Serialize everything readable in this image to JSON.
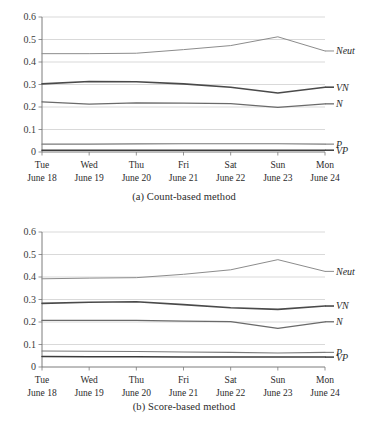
{
  "figures": [
    {
      "id": "a",
      "caption": "(a) Count-based method",
      "chart_data": {
        "type": "line",
        "title": "(a) Count-based method",
        "xlabel": "",
        "ylabel": "",
        "ylim": [
          0,
          0.6
        ],
        "yticks": [
          "0",
          "0.1",
          "0.2",
          "0.3",
          "0.4",
          "0.5",
          "0.6"
        ],
        "ytick_values": [
          0,
          0.1,
          0.2,
          0.3,
          0.4,
          0.5,
          0.6
        ],
        "grid": true,
        "legend": "right-inline-labels",
        "categories": [
          "Tue",
          "Wed",
          "Thu",
          "Fri",
          "Sat",
          "Sun",
          "Mon"
        ],
        "category_sublabels": [
          "June 18",
          "June 19",
          "June 20",
          "June 21",
          "June 22",
          "June 23",
          "June 24"
        ],
        "series": [
          {
            "name": "Neut",
            "color": "#8c8c8c",
            "width": 1.0,
            "values": [
              0.437,
              0.437,
              0.439,
              0.455,
              0.473,
              0.512,
              0.449
            ]
          },
          {
            "name": "VN",
            "color": "#4a4a4a",
            "width": 1.6,
            "values": [
              0.303,
              0.313,
              0.312,
              0.303,
              0.288,
              0.262,
              0.288
            ]
          },
          {
            "name": "N",
            "color": "#6a6a6a",
            "width": 1.3,
            "values": [
              0.223,
              0.213,
              0.218,
              0.217,
              0.215,
              0.198,
              0.214
            ]
          },
          {
            "name": "P",
            "color": "#7a7a7a",
            "width": 1.1,
            "values": [
              0.035,
              0.035,
              0.036,
              0.037,
              0.037,
              0.037,
              0.035
            ]
          },
          {
            "name": "VP",
            "color": "#3c3c3c",
            "width": 1.5,
            "values": [
              0.008,
              0.008,
              0.008,
              0.008,
              0.008,
              0.008,
              0.008
            ]
          }
        ]
      }
    },
    {
      "id": "b",
      "caption": "(b) Score-based method",
      "chart_data": {
        "type": "line",
        "title": "(b) Score-based method",
        "xlabel": "",
        "ylabel": "",
        "ylim": [
          0,
          0.6
        ],
        "yticks": [
          "0",
          "0.1",
          "0.2",
          "0.3",
          "0.4",
          "0.5",
          "0.6"
        ],
        "ytick_values": [
          0,
          0.1,
          0.2,
          0.3,
          0.4,
          0.5,
          0.6
        ],
        "grid": true,
        "legend": "right-inline-labels",
        "categories": [
          "Tue",
          "Wed",
          "Thu",
          "Fri",
          "Sat",
          "Sun",
          "Mon"
        ],
        "category_sublabels": [
          "June 18",
          "June 19",
          "June 20",
          "June 21",
          "June 22",
          "June 23",
          "June 24"
        ],
        "series": [
          {
            "name": "Neut",
            "color": "#8c8c8c",
            "width": 1.0,
            "values": [
              0.392,
              0.395,
              0.397,
              0.412,
              0.432,
              0.477,
              0.425
            ]
          },
          {
            "name": "VN",
            "color": "#4a4a4a",
            "width": 1.6,
            "values": [
              0.283,
              0.288,
              0.29,
              0.277,
              0.263,
              0.256,
              0.271
            ]
          },
          {
            "name": "N",
            "color": "#6a6a6a",
            "width": 1.3,
            "values": [
              0.207,
              0.207,
              0.207,
              0.204,
              0.202,
              0.172,
              0.201
            ]
          },
          {
            "name": "P",
            "color": "#7a7a7a",
            "width": 1.1,
            "values": [
              0.071,
              0.07,
              0.069,
              0.067,
              0.065,
              0.062,
              0.065
            ]
          },
          {
            "name": "VP",
            "color": "#3c3c3c",
            "width": 1.5,
            "values": [
              0.047,
              0.046,
              0.046,
              0.045,
              0.045,
              0.044,
              0.044
            ]
          }
        ]
      }
    }
  ]
}
